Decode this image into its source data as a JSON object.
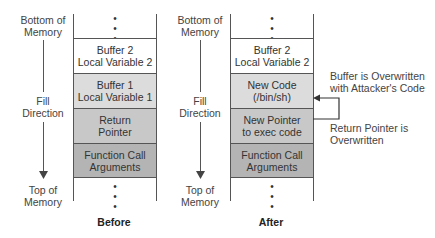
{
  "side_labels": {
    "bottom": [
      "Bottom of",
      "Memory"
    ],
    "fill": [
      "Fill",
      "Direction"
    ],
    "top": [
      "Top of",
      "Memory"
    ]
  },
  "before": {
    "caption": "Before",
    "cells": [
      {
        "line1": "Buffer 2",
        "line2": "Local Variable 2",
        "color": "#ffffff"
      },
      {
        "line1": "Buffer 1",
        "line2": "Local Variable 1",
        "color": "#dcdcdc"
      },
      {
        "line1": "Return",
        "line2": "Pointer",
        "color": "#c8c8c8"
      },
      {
        "line1": "Function Call",
        "line2": "Arguments",
        "color": "#b4b4b4"
      }
    ]
  },
  "after": {
    "caption": "After",
    "cells": [
      {
        "line1": "Buffer 2",
        "line2": "Local Variable 2",
        "color": "#ffffff"
      },
      {
        "line1": "New Code",
        "line2": "(/bin/sh)",
        "color": "#dcdcdc"
      },
      {
        "line1": "New Pointer",
        "line2": "to exec code",
        "color": "#c8c8c8"
      },
      {
        "line1": "Function Call",
        "line2": "Arguments",
        "color": "#b4b4b4"
      }
    ]
  },
  "annotations": {
    "buffer_overwritten": [
      "Buffer is Overwritten",
      "with Attacker's Code"
    ],
    "pointer_overwritten": [
      "Return Pointer is",
      "Overwritten"
    ]
  },
  "dots": "•"
}
